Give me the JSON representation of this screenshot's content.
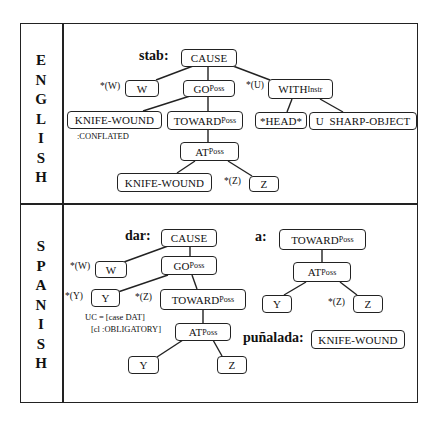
{
  "sections": [
    {
      "language": "ENGLISH",
      "letters": [
        "E",
        "N",
        "G",
        "L",
        "I",
        "S",
        "H"
      ],
      "entries": [
        {
          "word": "stab:",
          "nodes": {
            "cause": {
              "label": "CAUSE",
              "sub": ""
            },
            "w": {
              "label": "W",
              "sub": "",
              "marker": "*(W)"
            },
            "go": {
              "label": "GO",
              "sub": "Poss"
            },
            "with": {
              "label": "WITH",
              "sub": "Instr",
              "marker": "*(U)"
            },
            "knife_wound_conflated": {
              "label": "KNIFE-WOUND",
              "sub": "",
              "note": ":CONFLATED"
            },
            "toward": {
              "label": "TOWARD",
              "sub": "Poss"
            },
            "head": {
              "label": "*HEAD*",
              "sub": ""
            },
            "sharp_object": {
              "label": "U  SHARP-OBJECT",
              "sub": ""
            },
            "at": {
              "label": "AT",
              "sub": "Poss"
            },
            "knife_wound": {
              "label": "KNIFE-WOUND",
              "sub": ""
            },
            "z": {
              "label": "Z",
              "sub": "",
              "marker": "*(Z)"
            }
          }
        }
      ]
    },
    {
      "language": "SPANISH",
      "letters": [
        "S",
        "P",
        "A",
        "N",
        "I",
        "S",
        "H"
      ],
      "entries": [
        {
          "word": "dar:",
          "nodes": {
            "cause": {
              "label": "CAUSE",
              "sub": ""
            },
            "w": {
              "label": "W",
              "sub": "",
              "marker": "*(W)"
            },
            "go": {
              "label": "GO",
              "sub": "Poss"
            },
            "y": {
              "label": "Y",
              "sub": "",
              "marker": "*(Y)",
              "note_line1": "UC = [case DAT]",
              "note_line2": "[cl :OBLIGATORY]"
            },
            "toward": {
              "label": "TOWARD",
              "sub": "Poss",
              "marker": "*(Z)"
            },
            "at": {
              "label": "AT",
              "sub": "Poss"
            },
            "y2": {
              "label": "Y",
              "sub": ""
            },
            "z2": {
              "label": "Z",
              "sub": ""
            }
          }
        },
        {
          "word": "a:",
          "nodes": {
            "toward": {
              "label": "TOWARD",
              "sub": "Poss"
            },
            "at": {
              "label": "AT",
              "sub": "Poss"
            },
            "y": {
              "label": "Y",
              "sub": ""
            },
            "z": {
              "label": "Z",
              "sub": "",
              "marker": "*(Z)"
            }
          }
        },
        {
          "word": "puñalada:",
          "nodes": {
            "knife_wound": {
              "label": "KNIFE-WOUND",
              "sub": ""
            }
          }
        }
      ]
    }
  ]
}
